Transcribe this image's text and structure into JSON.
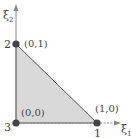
{
  "diagram": {
    "type": "reference-triangle",
    "axes": {
      "x_label": "ξ",
      "x_subscript": "1",
      "y_label": "ξ",
      "y_subscript": "2"
    },
    "vertices": [
      {
        "node_number": "1",
        "coord_label": "(1,0)"
      },
      {
        "node_number": "2",
        "coord_label": "(0,1)"
      },
      {
        "node_number": "3",
        "coord_label": "(0,0)"
      }
    ],
    "colors": {
      "fill": "#d9d9d9",
      "edge": "#555555",
      "axis": "#888888",
      "node": "#444444",
      "text": "#444444"
    }
  }
}
